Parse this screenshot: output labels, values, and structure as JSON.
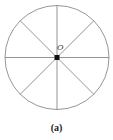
{
  "figure": {
    "center_label": "O",
    "caption": "(a)",
    "circle": {
      "cx": 57,
      "cy": 57.5,
      "r": 52,
      "stroke": "#888888"
    },
    "spokes": 8,
    "center_dot_color": "#111111"
  }
}
